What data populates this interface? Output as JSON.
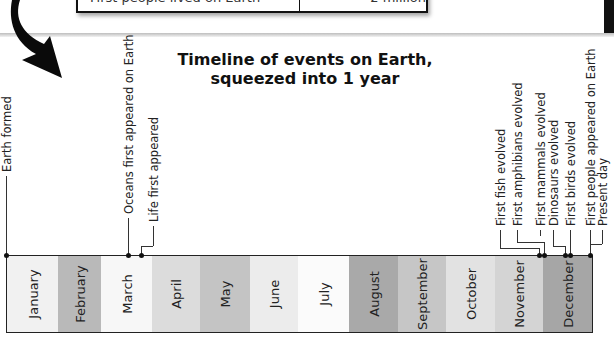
{
  "top_table": {
    "row_label": "First people lived on Earth",
    "row_value": "2 million"
  },
  "title": {
    "line1": "Timeline of events on Earth,",
    "line2": "squeezed into 1 year"
  },
  "months": [
    {
      "label": "January",
      "color": "#f1f1f1"
    },
    {
      "label": "February",
      "color": "#b9b9b9"
    },
    {
      "label": "March",
      "color": "#f7f7f7"
    },
    {
      "label": "April",
      "color": "#dcdcdc"
    },
    {
      "label": "May",
      "color": "#c4c4c4"
    },
    {
      "label": "June",
      "color": "#ececec"
    },
    {
      "label": "July",
      "color": "#fbfbfb"
    },
    {
      "label": "August",
      "color": "#a9a9a9"
    },
    {
      "label": "September",
      "color": "#c6c6c6"
    },
    {
      "label": "October",
      "color": "#e2e2e2"
    },
    {
      "label": "November",
      "color": "#d4d4d4"
    },
    {
      "label": "December",
      "color": "#a6a6a6"
    }
  ],
  "events": [
    {
      "label": "Earth formed"
    },
    {
      "label": "Oceans first appeared on Earth"
    },
    {
      "label": "Life first appeared"
    },
    {
      "label": "First fish evolved"
    },
    {
      "label": "First amphibians evolved"
    },
    {
      "label": "First mammals evolved"
    },
    {
      "label": "Dinosaurs evolved"
    },
    {
      "label": "First birds evolved"
    },
    {
      "label": "First people appeared on Earth"
    },
    {
      "label": "Present day"
    }
  ]
}
